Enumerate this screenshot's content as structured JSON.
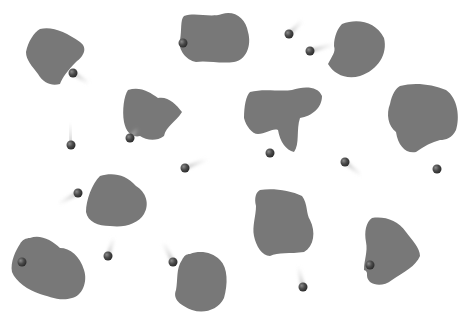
{
  "scene": {
    "width": 471,
    "height": 320,
    "background": "#ffffff",
    "blob_color": "#787878",
    "ball_color": "#4a4a4a"
  },
  "blobs": [
    {
      "id": "blob-1",
      "d": "M40,29 C52,26 66,32 80,42 C88,48 84,56 76,62 C68,70 62,78 60,84 C52,86 44,84 38,74 C32,66 26,60 26,52 C28,42 34,32 40,29 Z"
    },
    {
      "id": "blob-2",
      "d": "M184,16 C196,12 210,18 222,14 C234,10 246,18 248,32 C252,46 246,60 234,62 C220,64 206,60 196,62 C186,60 178,50 180,40 C182,30 180,20 184,16 Z"
    },
    {
      "id": "blob-3",
      "d": "M128,90 C140,86 150,92 158,98 C168,96 176,104 182,112 C176,122 166,126 164,136 C156,142 146,140 140,136 C132,138 126,132 124,122 C122,110 124,96 128,90 Z"
    },
    {
      "id": "blob-4",
      "d": "M342,24 C358,18 376,22 384,38 C388,54 378,70 360,76 C346,80 334,74 328,64 C332,56 336,52 334,46 C334,36 338,28 342,24 Z"
    },
    {
      "id": "blob-5",
      "d": "M250,92 C264,88 280,92 292,90 C304,86 318,86 322,96 C322,108 312,116 300,118 C296,130 300,144 294,152 C286,150 280,142 278,130 C272,128 266,134 258,134 C252,134 246,126 244,118 C244,106 246,96 250,92 Z"
    },
    {
      "id": "blob-6",
      "d": "M400,86 C414,82 432,84 446,90 C458,98 460,118 456,130 C452,138 446,140 440,140 C432,142 424,146 416,152 C406,154 398,146 396,132 C388,126 386,114 390,104 C392,94 396,88 400,86 Z"
    },
    {
      "id": "blob-7",
      "d": "M100,176 C112,172 126,174 136,186 C146,192 150,204 144,214 C138,224 124,228 110,226 C98,226 88,222 86,212 C86,200 92,184 100,176 Z"
    },
    {
      "id": "blob-8",
      "d": "M30,238 C40,234 52,240 60,248 C70,248 80,256 84,270 C88,282 82,296 72,298 C60,302 48,296 40,294 C28,290 16,282 12,272 C10,262 16,250 20,244 C22,240 26,238 30,238 Z"
    },
    {
      "id": "blob-9",
      "d": "M260,190 C272,188 290,190 302,196 C308,204 306,214 310,220 C316,232 314,246 304,252 C290,254 278,252 270,256 C262,256 256,246 254,236 C252,226 256,216 256,206 C254,198 256,192 260,190 Z"
    },
    {
      "id": "blob-10",
      "d": "M372,218 C384,216 398,220 406,232 C412,240 420,248 420,256 C416,266 404,272 392,280 C384,286 376,286 370,282 C364,276 370,272 364,270 C364,260 368,252 366,242 C364,232 366,222 372,218 Z"
    },
    {
      "id": "blob-11",
      "d": "M190,254 C200,250 212,252 220,260 C228,268 228,284 224,298 C218,310 204,314 192,310 C182,306 172,300 176,290 C178,280 176,268 182,260 C184,256 186,254 190,254 Z"
    }
  ],
  "balls": [
    {
      "id": "ball-1",
      "cx": 73,
      "cy": 73,
      "r": 4.5,
      "trail": {
        "x2": 90,
        "y2": 84
      }
    },
    {
      "id": "ball-2",
      "cx": 183,
      "cy": 43,
      "r": 4.5,
      "trail": null
    },
    {
      "id": "ball-3",
      "cx": 71,
      "cy": 145,
      "r": 4.5,
      "trail": {
        "x2": 70,
        "y2": 122
      }
    },
    {
      "id": "ball-4",
      "cx": 130,
      "cy": 138,
      "r": 4.5,
      "trail": {
        "x2": 138,
        "y2": 128
      }
    },
    {
      "id": "ball-5",
      "cx": 289,
      "cy": 34,
      "r": 4.5,
      "trail": {
        "x2": 303,
        "y2": 20
      }
    },
    {
      "id": "ball-6",
      "cx": 310,
      "cy": 51,
      "r": 4.5,
      "trail": {
        "x2": 335,
        "y2": 44
      }
    },
    {
      "id": "ball-7",
      "cx": 270,
      "cy": 153,
      "r": 4.5,
      "trail": {
        "x2": 270,
        "y2": 132
      }
    },
    {
      "id": "ball-8",
      "cx": 345,
      "cy": 162,
      "r": 4.5,
      "trail": {
        "x2": 362,
        "y2": 176
      }
    },
    {
      "id": "ball-9",
      "cx": 437,
      "cy": 169,
      "r": 4.5,
      "trail": {
        "x2": 437,
        "y2": 148
      }
    },
    {
      "id": "ball-10",
      "cx": 185,
      "cy": 168,
      "r": 4.5,
      "trail": {
        "x2": 208,
        "y2": 159
      }
    },
    {
      "id": "ball-11",
      "cx": 78,
      "cy": 193,
      "r": 4.5,
      "trail": {
        "x2": 58,
        "y2": 204
      }
    },
    {
      "id": "ball-12",
      "cx": 22,
      "cy": 262,
      "r": 4.5,
      "trail": null
    },
    {
      "id": "ball-13",
      "cx": 108,
      "cy": 256,
      "r": 4.5,
      "trail": {
        "x2": 114,
        "y2": 237
      }
    },
    {
      "id": "ball-14",
      "cx": 173,
      "cy": 262,
      "r": 4.5,
      "trail": {
        "x2": 163,
        "y2": 242
      }
    },
    {
      "id": "ball-15",
      "cx": 303,
      "cy": 287,
      "r": 4.5,
      "trail": {
        "x2": 298,
        "y2": 266
      }
    },
    {
      "id": "ball-16",
      "cx": 370,
      "cy": 265,
      "r": 4.5,
      "trail": {
        "x2": 346,
        "y2": 265
      }
    }
  ]
}
